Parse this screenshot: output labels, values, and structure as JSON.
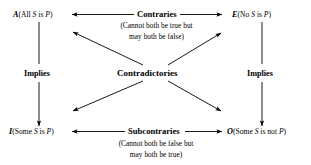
{
  "diagram": {
    "ink_color": "#000000",
    "background_color": "#ffffff",
    "corners": {
      "a": {
        "letter": "A",
        "open": "(All ",
        "subject": "S",
        "mid": " is ",
        "predicate": "P",
        "close": ")"
      },
      "e": {
        "letter": "E",
        "open": "(No ",
        "subject": "S",
        "mid": " is ",
        "predicate": "P",
        "close": ")"
      },
      "i": {
        "letter": "I",
        "open": "(Some ",
        "subject": "S",
        "mid": " is ",
        "predicate": "P",
        "close": ")"
      },
      "o": {
        "letter": "O",
        "open": "(Some ",
        "subject": "S",
        "mid": " is not ",
        "predicate": "P",
        "close": ")"
      }
    },
    "relations": {
      "contraries": {
        "label": "Contraries",
        "gloss_line1": "(Cannot both be true but",
        "gloss_line2": "may both be false)"
      },
      "subcontraries": {
        "label": "Subcontraries",
        "gloss_line1": "(Cannot both be false but",
        "gloss_line2": "may both be true)"
      },
      "contradictories": {
        "label": "Contradictories"
      },
      "implies_left": {
        "label": "Implies"
      },
      "implies_right": {
        "label": "Implies"
      }
    }
  }
}
